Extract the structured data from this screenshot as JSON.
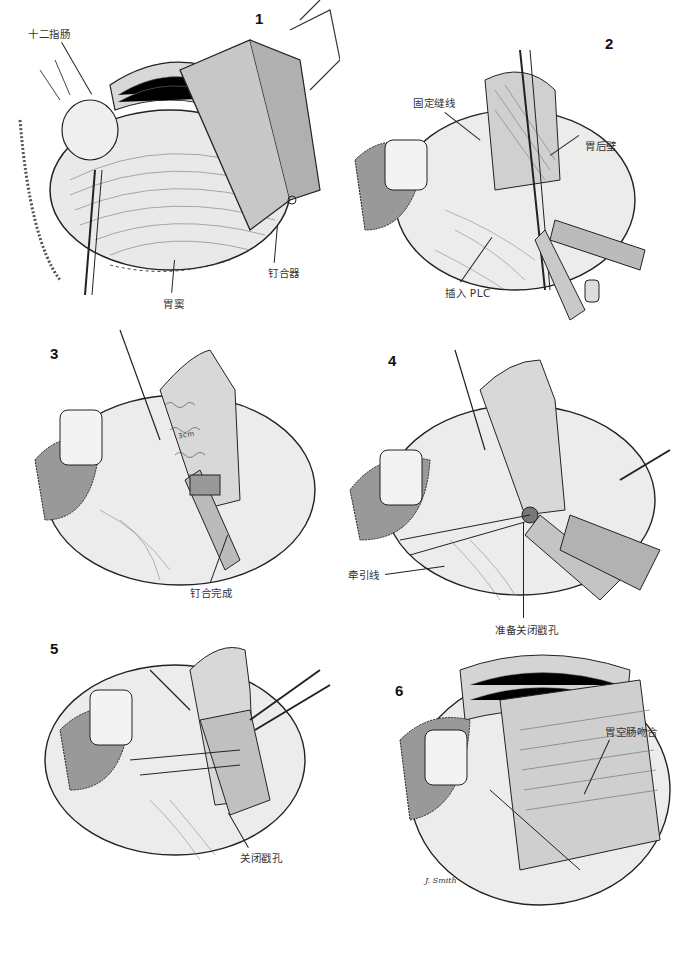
{
  "page": {
    "header_text": "",
    "figures": [
      {
        "number": "1",
        "labels": [
          {
            "text": "十二指肠",
            "id": "duodenum"
          },
          {
            "text": "胃窦",
            "id": "antrum"
          },
          {
            "text": "钉合器",
            "id": "stapler"
          }
        ]
      },
      {
        "number": "2",
        "labels": [
          {
            "text": "固定缝线",
            "id": "stay-suture"
          },
          {
            "text": "胃后壁",
            "id": "posterior-gastric-wall"
          },
          {
            "text": "插入 PLC",
            "id": "insert-plc"
          }
        ]
      },
      {
        "number": "3",
        "labels": [
          {
            "text": "钉合完成",
            "id": "stapling-complete"
          }
        ],
        "annotation": "3cm"
      },
      {
        "number": "4",
        "labels": [
          {
            "text": "牵引线",
            "id": "traction-suture"
          },
          {
            "text": "准备关闭戳孔",
            "id": "prepare-close-stab-hole"
          }
        ]
      },
      {
        "number": "5",
        "labels": [
          {
            "text": "关闭戳孔",
            "id": "close-stab-hole"
          }
        ]
      },
      {
        "number": "6",
        "labels": [
          {
            "text": "胃空肠吻合",
            "id": "gastrojejunostomy"
          }
        ],
        "signature": "J. Smith"
      }
    ]
  }
}
